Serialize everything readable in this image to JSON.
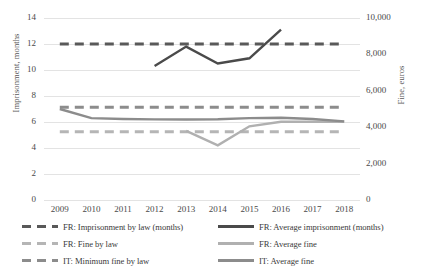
{
  "chart_data": {
    "type": "line",
    "title": "",
    "xlabel": "",
    "x": [
      2009,
      2010,
      2011,
      2012,
      2013,
      2014,
      2015,
      2016,
      2017,
      2018
    ],
    "axes": {
      "left": {
        "label": "Imprisonment, months",
        "ticks": [
          "0",
          "2",
          "4",
          "6",
          "8",
          "10",
          "12",
          "14"
        ],
        "tick_values": [
          0,
          2,
          4,
          6,
          8,
          10,
          12,
          14
        ],
        "ylim": [
          0,
          14
        ]
      },
      "right": {
        "label": "Fine, euros",
        "ticks": [
          "0",
          "2,000",
          "4,000",
          "6,000",
          "8,000",
          "10,000"
        ],
        "tick_values": [
          0,
          2000,
          4000,
          6000,
          8000,
          10000
        ],
        "ylim": [
          0,
          10000
        ]
      }
    },
    "grid": true,
    "legend_position": "bottom",
    "series": [
      {
        "name": "FR: Imprisonment by law (months)",
        "axis": "left",
        "style": "dashed",
        "color": "#595959",
        "width": 3,
        "values": [
          12,
          12,
          12,
          12,
          12,
          12,
          12,
          12,
          12,
          12
        ]
      },
      {
        "name": "FR: Average imprisonment (months)",
        "axis": "left",
        "style": "solid",
        "color": "#4a4a4a",
        "width": 2.4,
        "values": [
          null,
          null,
          null,
          10.3,
          11.8,
          10.5,
          10.9,
          13.1,
          null,
          null
        ]
      },
      {
        "name": "FR: Fine by law",
        "axis": "right",
        "style": "dashed",
        "color": "#b5b5b5",
        "width": 3,
        "values": [
          3750,
          3750,
          3750,
          3750,
          3750,
          3750,
          3750,
          3750,
          3750,
          3750
        ]
      },
      {
        "name": "FR: Average fine",
        "axis": "right",
        "style": "solid",
        "color": "#b0b0b0",
        "width": 2.4,
        "values": [
          null,
          null,
          null,
          null,
          3800,
          3000,
          4050,
          4300,
          4300,
          4300
        ]
      },
      {
        "name": "IT: Minimum fine by law",
        "axis": "right",
        "style": "dashed",
        "color": "#8c8c8c",
        "width": 3,
        "values": [
          5100,
          5100,
          5100,
          5100,
          5100,
          5100,
          5100,
          5100,
          5100,
          5100
        ]
      },
      {
        "name": "IT: Average fine",
        "axis": "right",
        "style": "solid",
        "color": "#8c8c8c",
        "width": 2.4,
        "values": [
          5000,
          4500,
          4450,
          4430,
          4420,
          4440,
          4500,
          4520,
          4450,
          4320
        ]
      }
    ]
  },
  "legend": {
    "items": [
      {
        "label": "FR: Imprisonment by law (months)",
        "style": "dashed",
        "color": "#595959"
      },
      {
        "label": "FR: Average imprisonment (months)",
        "style": "solid",
        "color": "#4a4a4a"
      },
      {
        "label": "FR: Fine by law",
        "style": "dashed",
        "color": "#b5b5b5"
      },
      {
        "label": "FR: Average fine",
        "style": "solid",
        "color": "#b0b0b0"
      },
      {
        "label": "IT: Minimum fine by law",
        "style": "dashed",
        "color": "#8c8c8c"
      },
      {
        "label": "IT: Average fine",
        "style": "solid",
        "color": "#8c8c8c"
      }
    ]
  }
}
